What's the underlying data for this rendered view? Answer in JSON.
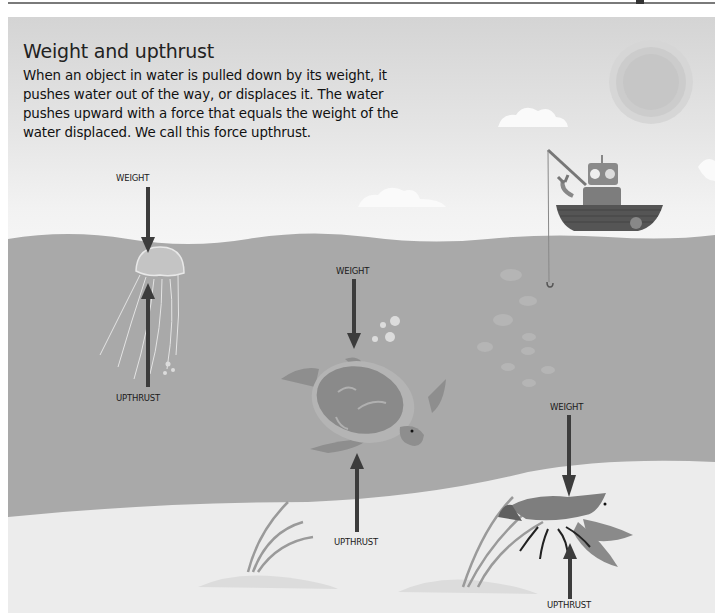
{
  "page": {
    "title": "Weight and upthrust",
    "intro": "When an object in water is pulled down by its weight, it pushes water out of the way, or displaces it. The water pushes upward with a force that equals the weight of the water displaced. We call this force upthrust."
  },
  "labels": {
    "jellyfish": {
      "weight": "WEIGHT",
      "upthrust": "UPTHRUST"
    },
    "turtle": {
      "weight": "WEIGHT",
      "upthrust": "UPTHRUST"
    },
    "lobster": {
      "weight": "WEIGHT",
      "upthrust": "UPTHRUST"
    }
  },
  "scene": {
    "elements": [
      "sun",
      "clouds",
      "robot-in-boat",
      "fishing-line",
      "fish-school",
      "jellyfish",
      "sea-turtle",
      "lobster",
      "seaweed",
      "seabed"
    ],
    "colors": {
      "sky_top": "#d4d4d4",
      "sky_bottom": "#f5f5f5",
      "water": "#a9a9a9",
      "seabed": "#ececec",
      "arrow": "#3c3c3c"
    }
  }
}
